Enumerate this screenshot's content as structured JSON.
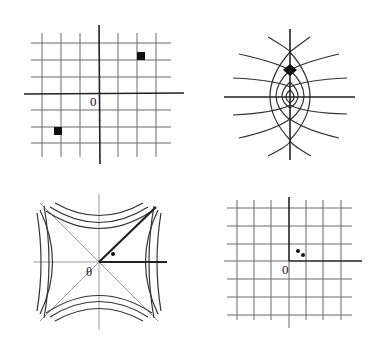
{
  "panels": [
    {
      "id": "top-left",
      "description": "Square grid with coordinate axes; two filled squares at symmetric points",
      "origin_label": "0",
      "markers": [
        {
          "shape": "square",
          "quadrant": "upper-right"
        },
        {
          "shape": "square",
          "quadrant": "lower-left"
        }
      ]
    },
    {
      "id": "top-right",
      "description": "Curvilinear grid (parabolic coordinates) with filled diamond on the vertical axis",
      "markers": [
        {
          "shape": "diamond",
          "position": "upper vertical axis"
        }
      ]
    },
    {
      "id": "bottom-left",
      "description": "Hyperbolic level curves with diagonal asymptotes; thick ray at 45° and along positive x-axis",
      "origin_label": "θ",
      "markers": [
        {
          "shape": "dot",
          "position": "between rays"
        }
      ]
    },
    {
      "id": "bottom-right",
      "description": "Square grid with emphasized first-quadrant axes and two small dots near origin",
      "origin_label": "0",
      "markers": [
        {
          "shape": "dot"
        },
        {
          "shape": "dot"
        }
      ]
    }
  ],
  "colors": {
    "background": "#ffffff",
    "ink": "#222222",
    "grid": "#6a6a6a",
    "light": "#9a9a9a"
  }
}
